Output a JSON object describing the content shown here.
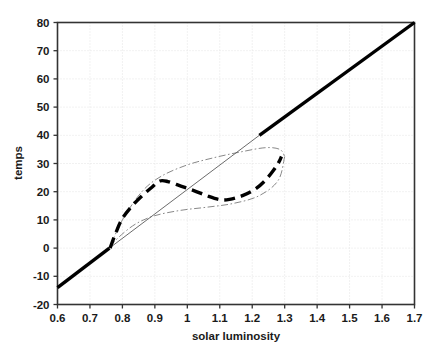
{
  "chart_data": {
    "type": "line",
    "title": "",
    "xlabel": "solar luminosity",
    "ylabel": "temps",
    "xlim": [
      0.6,
      1.7
    ],
    "ylim": [
      -20,
      80
    ],
    "grid": true,
    "legend": "none",
    "xticks": [
      "0.6",
      "0.7",
      "0.8",
      "0.9",
      "1",
      "1.1",
      "1.2",
      "1.3",
      "1.4",
      "1.5",
      "1.6",
      "1.7"
    ],
    "xtick_values": [
      0.6,
      0.7,
      0.8,
      0.9,
      1.0,
      1.1,
      1.2,
      1.3,
      1.4,
      1.5,
      1.6,
      1.7
    ],
    "yticks": [
      "80",
      "70",
      "60",
      "50",
      "40",
      "30",
      "20",
      "10",
      "0",
      "-10",
      "-20"
    ],
    "ytick_values": [
      80,
      70,
      60,
      50,
      40,
      30,
      20,
      10,
      0,
      -10,
      -20
    ],
    "series": [
      {
        "name": "stable-branch-thick-solid",
        "style": "solid",
        "width": 3.4,
        "color": "#000000",
        "comment": "Thick solid diagonal: lower-left stable branch and upper-right stable branch",
        "segments": [
          {
            "name": "lower-stable",
            "x": [
              0.6,
              0.76
            ],
            "y": [
              -14.0,
              0.0
            ]
          },
          {
            "name": "upper-stable",
            "x": [
              1.222,
              1.7
            ],
            "y": [
              40.0,
              80.0
            ]
          }
        ]
      },
      {
        "name": "unstable-branch-thin-solid",
        "style": "solid",
        "width": 0.9,
        "color": "#5a5a5a",
        "comment": "Thin straight diagonal connecting the two thick branches through the hysteresis loop",
        "x": [
          0.76,
          1.222
        ],
        "y": [
          0.0,
          40.0
        ]
      },
      {
        "name": "hysteresis-loop-thin-dashdot",
        "style": "dash-dot",
        "width": 0.9,
        "color": "#7a7a7a",
        "comment": "Thin dash-dot lens/ellipse loop enclosing the hysteresis region",
        "upper_x": [
          0.762,
          0.8,
          0.86,
          0.92,
          1.0,
          1.08,
          1.16,
          1.24,
          1.285,
          1.3
        ],
        "upper_y": [
          0.5,
          10.0,
          20.0,
          25.5,
          29.5,
          32.0,
          34.0,
          35.6,
          35.0,
          32.5
        ],
        "lower_x": [
          0.762,
          0.79,
          0.84,
          0.9,
          0.98,
          1.06,
          1.14,
          1.22,
          1.28,
          1.3
        ],
        "lower_y": [
          0.5,
          4.0,
          8.5,
          11.5,
          13.4,
          14.5,
          15.8,
          18.5,
          24.0,
          32.5
        ]
      },
      {
        "name": "trajectory-thick-dashed",
        "style": "dashed",
        "width": 3.4,
        "color": "#000000",
        "comment": "Thick dashed S-shaped trajectory inside the loop: rises to local max ~24 at 0.92, dips to ~17 at 1.10, then rises to ~32 at 1.28",
        "x": [
          0.762,
          0.78,
          0.8,
          0.83,
          0.86,
          0.89,
          0.915,
          0.94,
          0.98,
          1.02,
          1.06,
          1.1,
          1.13,
          1.17,
          1.21,
          1.24,
          1.265,
          1.282,
          1.29
        ],
        "y": [
          0.0,
          5.5,
          10.5,
          15.0,
          18.5,
          21.5,
          23.8,
          23.6,
          22.0,
          20.4,
          18.6,
          17.2,
          17.3,
          18.6,
          21.0,
          24.0,
          27.5,
          30.5,
          32.5
        ]
      }
    ]
  },
  "axes": {
    "xlabel": "solar luminosity",
    "ylabel": "temps"
  }
}
